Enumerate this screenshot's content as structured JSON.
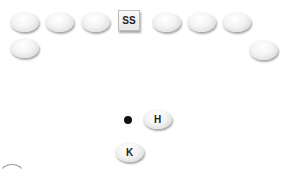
{
  "diagram": {
    "type": "football-formation",
    "players": [
      {
        "id": "p1",
        "shape": "oval",
        "label": "",
        "x": 10,
        "y": 12
      },
      {
        "id": "p2",
        "shape": "oval",
        "label": "",
        "x": 45,
        "y": 12
      },
      {
        "id": "p3",
        "shape": "oval",
        "label": "",
        "x": 81,
        "y": 12
      },
      {
        "id": "ss",
        "shape": "box",
        "label": "SS",
        "x": 118,
        "y": 10
      },
      {
        "id": "p5",
        "shape": "oval",
        "label": "",
        "x": 152,
        "y": 12
      },
      {
        "id": "p6",
        "shape": "oval",
        "label": "",
        "x": 187,
        "y": 12
      },
      {
        "id": "p7",
        "shape": "oval",
        "label": "",
        "x": 222,
        "y": 12
      },
      {
        "id": "p8",
        "shape": "oval",
        "label": "",
        "x": 10,
        "y": 38
      },
      {
        "id": "p9",
        "shape": "oval",
        "label": "",
        "x": 249,
        "y": 40
      },
      {
        "id": "h",
        "shape": "oval",
        "label": "H",
        "x": 143,
        "y": 109
      },
      {
        "id": "k",
        "shape": "oval",
        "label": "K",
        "x": 115,
        "y": 142
      }
    ],
    "ball": {
      "x": 124,
      "y": 116
    }
  }
}
